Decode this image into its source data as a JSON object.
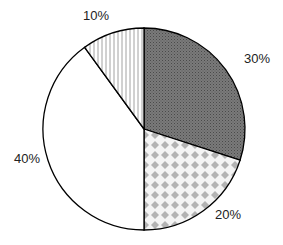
{
  "chart_data": {
    "type": "pie",
    "title": "",
    "start_angle_deg": 90,
    "direction": "clockwise",
    "slices": [
      {
        "label": "30%",
        "value": 30,
        "pattern": "dark-dots",
        "color": "#6e6e6e"
      },
      {
        "label": "20%",
        "value": 20,
        "pattern": "diamond-checker",
        "color": "#b0b0b0"
      },
      {
        "label": "40%",
        "value": 40,
        "pattern": "none",
        "color": "#ffffff"
      },
      {
        "label": "10%",
        "value": 10,
        "pattern": "vertical-lines",
        "color": "#ffffff"
      }
    ],
    "values": [
      30,
      20,
      40,
      10
    ],
    "categories": [
      "30%",
      "20%",
      "40%",
      "10%"
    ],
    "legend": "none",
    "edge_color": "#000000"
  }
}
